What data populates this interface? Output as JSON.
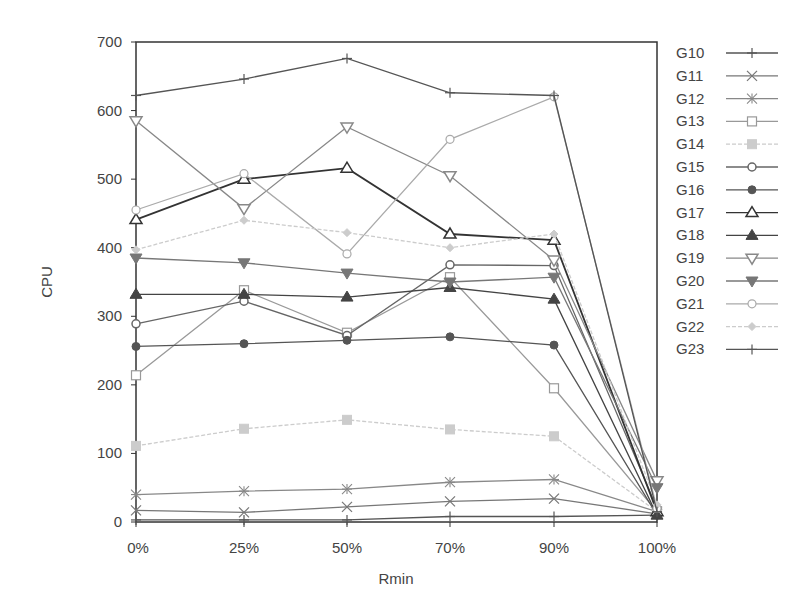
{
  "chart_data": {
    "type": "line",
    "title": "",
    "xlabel": "Rmin",
    "ylabel": "CPU",
    "categories": [
      "0%",
      "25%",
      "50%",
      "70%",
      "90%",
      "100%"
    ],
    "ylim": [
      0,
      700
    ],
    "yticks": [
      0,
      100,
      200,
      300,
      400,
      500,
      600,
      700
    ],
    "grid": false,
    "legend_position": "right",
    "series": [
      {
        "name": "G10",
        "marker": "plus",
        "color": "#555555",
        "values": [
          3,
          3,
          3,
          8,
          8,
          10
        ]
      },
      {
        "name": "G11",
        "marker": "x",
        "color": "#777777",
        "values": [
          17,
          14,
          22,
          30,
          34,
          12
        ]
      },
      {
        "name": "G12",
        "marker": "star",
        "color": "#888888",
        "values": [
          40,
          45,
          48,
          58,
          62,
          15
        ]
      },
      {
        "name": "G13",
        "marker": "square-open",
        "color": "#999999",
        "values": [
          214,
          338,
          276,
          357,
          195,
          15
        ]
      },
      {
        "name": "G14",
        "marker": "square-filled",
        "color": "#cccccc",
        "values": [
          111,
          136,
          149,
          135,
          125,
          15
        ]
      },
      {
        "name": "G15",
        "marker": "circle-open",
        "color": "#666666",
        "values": [
          289,
          322,
          272,
          375,
          374,
          20
        ]
      },
      {
        "name": "G16",
        "marker": "circle-filled",
        "color": "#555555",
        "values": [
          256,
          260,
          265,
          270,
          258,
          10
        ]
      },
      {
        "name": "G17",
        "marker": "triangle-up-open",
        "color": "#333333",
        "values": [
          441,
          500,
          516,
          420,
          411,
          15
        ]
      },
      {
        "name": "G18",
        "marker": "triangle-up-filled",
        "color": "#444444",
        "values": [
          332,
          332,
          328,
          342,
          325,
          10
        ]
      },
      {
        "name": "G19",
        "marker": "triangle-down-open",
        "color": "#888888",
        "values": [
          585,
          457,
          576,
          505,
          382,
          60
        ]
      },
      {
        "name": "G20",
        "marker": "triangle-down-filled",
        "color": "#777777",
        "values": [
          385,
          378,
          363,
          350,
          357,
          50
        ]
      },
      {
        "name": "G21",
        "marker": "diamond-open",
        "color": "#aaaaaa",
        "values": [
          455,
          508,
          391,
          558,
          620,
          20
        ]
      },
      {
        "name": "G22",
        "marker": "diamond-filled",
        "color": "#cccccc",
        "values": [
          397,
          440,
          422,
          400,
          420,
          25
        ]
      },
      {
        "name": "G23",
        "marker": "plus",
        "color": "#555555",
        "values": [
          622,
          646,
          676,
          626,
          622,
          15
        ]
      }
    ]
  }
}
